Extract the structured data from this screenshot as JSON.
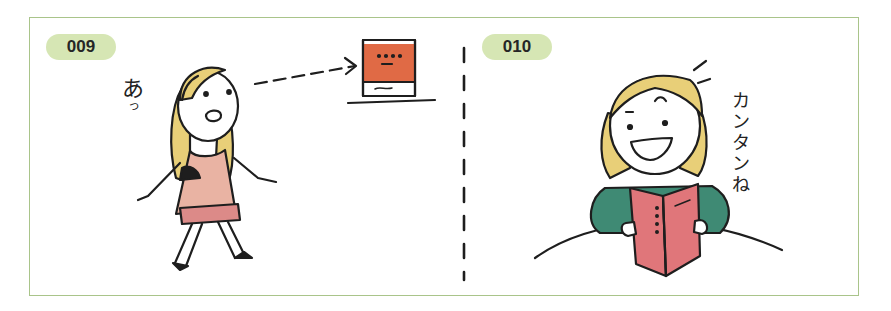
{
  "panels": [
    {
      "number": "009",
      "exclamation_main": "あ",
      "exclamation_small": "っ",
      "scene": "girl walking, notices a book on a shelf (dashed arrow)"
    },
    {
      "number": "010",
      "speech": [
        "カ",
        "ン",
        "タ",
        "ン",
        "ね"
      ],
      "speech_full": "カンタンね",
      "scene": "smiling girl reading an open red book"
    }
  ],
  "colors": {
    "frame_border": "#a9c48a",
    "badge_bg": "#d6e6b4",
    "hair": "#e8cf78",
    "dress": "#e9b3a3",
    "skirt": "#dc8a88",
    "book_cover_orange": "#e06a45",
    "book_red": "#e0767a",
    "sweater": "#3f8a74",
    "ink": "#1e1e1e"
  }
}
